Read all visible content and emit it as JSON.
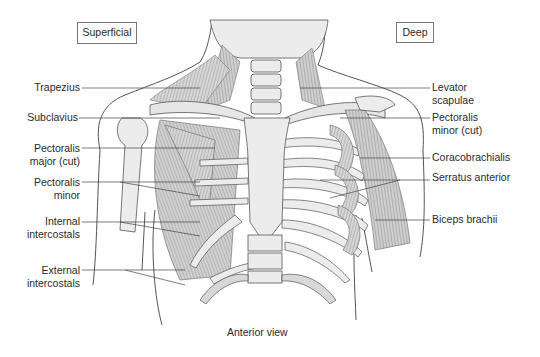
{
  "figure": {
    "view_caption": "Anterior view",
    "panels": {
      "left": "Superficial",
      "right": "Deep"
    },
    "labels_left": [
      {
        "line1": "Trapezius",
        "line2": ""
      },
      {
        "line1": "Subclavius",
        "line2": ""
      },
      {
        "line1": "Pectoralis",
        "line2": "major (cut)"
      },
      {
        "line1": "Pectoralis",
        "line2": "minor"
      },
      {
        "line1": "Internal",
        "line2": "intercostals"
      },
      {
        "line1": "External",
        "line2": "intercostals"
      }
    ],
    "labels_right": [
      {
        "line1": "Levator",
        "line2": "scapulae"
      },
      {
        "line1": "Pectoralis",
        "line2": "minor (cut)"
      },
      {
        "line1": "Coracobrachialis",
        "line2": ""
      },
      {
        "line1": "Serratus anterior",
        "line2": ""
      },
      {
        "line1": "Biceps brachii",
        "line2": ""
      }
    ],
    "colors": {
      "outline": "#555555",
      "muscle_fill": "#c9c9c9",
      "bone_fill": "#ececec",
      "leader_line": "#444444"
    }
  }
}
